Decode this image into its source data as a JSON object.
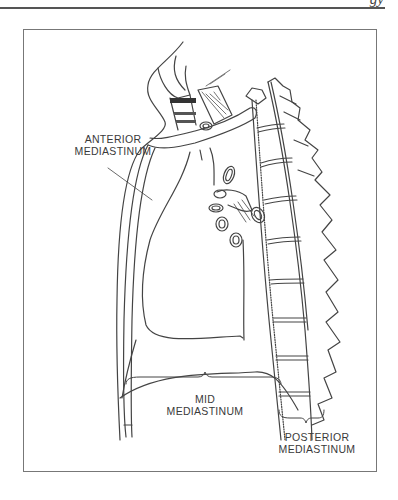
{
  "header": {
    "fragment": "gy"
  },
  "figure": {
    "labels": {
      "anterior": [
        "ANTERIOR",
        "MEDIASTINUM"
      ],
      "mid": [
        "MID",
        "MEDIASTINUM"
      ],
      "posterior": [
        "POSTERIOR",
        "MEDIASTINUM"
      ]
    },
    "colors": {
      "line": "#444444",
      "frame": "#777777",
      "background": "#ffffff"
    }
  }
}
